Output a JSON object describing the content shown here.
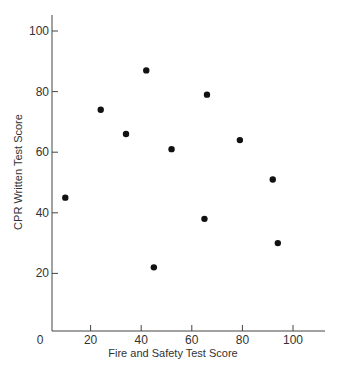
{
  "chart_data": {
    "type": "scatter",
    "title": "",
    "xlabel": "Fire and Safety Test Score",
    "ylabel": "CPR Written Test Score",
    "xlim": [
      5,
      113
    ],
    "ylim": [
      1,
      105
    ],
    "x_ticks": [
      0,
      20,
      40,
      60,
      80,
      100
    ],
    "y_ticks": [
      20,
      40,
      60,
      80,
      100
    ],
    "grid": false,
    "legend": null,
    "points": [
      {
        "x": 10,
        "y": 45
      },
      {
        "x": 24,
        "y": 74
      },
      {
        "x": 34,
        "y": 66
      },
      {
        "x": 42,
        "y": 87
      },
      {
        "x": 45,
        "y": 22
      },
      {
        "x": 52,
        "y": 61
      },
      {
        "x": 65,
        "y": 38
      },
      {
        "x": 66,
        "y": 79
      },
      {
        "x": 79,
        "y": 64
      },
      {
        "x": 92,
        "y": 51
      },
      {
        "x": 94,
        "y": 30
      }
    ],
    "colors": {
      "marker": "#111111",
      "axis": "#444444"
    }
  }
}
